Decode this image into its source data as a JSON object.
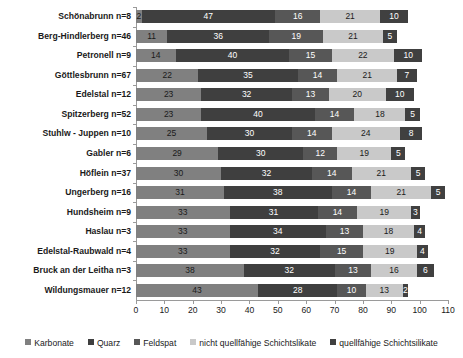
{
  "chart_data": {
    "type": "bar",
    "orientation": "horizontal",
    "stacked": true,
    "title": "",
    "xlabel": "",
    "ylabel": "",
    "xlim": [
      0,
      110
    ],
    "xticks": [
      0,
      10,
      20,
      30,
      40,
      50,
      60,
      70,
      80,
      90,
      100,
      110
    ],
    "grid": false,
    "legend_position": "bottom",
    "categories": [
      "Schönabrunn  n=8",
      "Berg-Hindlerberg n=46",
      "Petronell n=9",
      "Göttlesbrunn n=67",
      "Edelstal n=12",
      "Spitzerberg n=52",
      "Stuhlw - Juppen n=10",
      "Gabler n=6",
      "Höflein n=37",
      "Ungerberg n=16",
      "Hundsheim n=9",
      "Haslau n=3",
      "Edelstal-Raubwald n=4",
      "Bruck an der Leitha n=3",
      "Wildungsmauer n=12"
    ],
    "series": [
      {
        "name": "Karbonate",
        "color": "#808080",
        "values": [
          2,
          11,
          14,
          22,
          23,
          23,
          25,
          29,
          30,
          31,
          33,
          33,
          33,
          38,
          43
        ]
      },
      {
        "name": "Quarz",
        "color": "#3f3f3f",
        "values": [
          47,
          36,
          40,
          35,
          32,
          40,
          30,
          30,
          32,
          38,
          31,
          34,
          32,
          32,
          28
        ]
      },
      {
        "name": "Feldspat",
        "color": "#575757",
        "values": [
          16,
          19,
          15,
          14,
          13,
          14,
          14,
          12,
          14,
          14,
          14,
          13,
          15,
          13,
          10
        ]
      },
      {
        "name": "nicht quellfähige Schichtslikate",
        "color": "#c9c9c9",
        "values": [
          21,
          21,
          22,
          21,
          20,
          18,
          24,
          19,
          21,
          21,
          19,
          18,
          19,
          16,
          13
        ]
      },
      {
        "name": "quellfähige Schichtsilikate",
        "color": "#404040",
        "values": [
          10,
          5,
          10,
          7,
          10,
          5,
          8,
          5,
          5,
          5,
          3,
          4,
          4,
          6,
          2
        ]
      }
    ]
  }
}
